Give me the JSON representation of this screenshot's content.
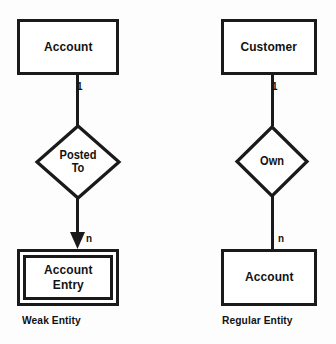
{
  "diagram": {
    "type": "entity-relationship-diagram",
    "background_color": "#fdfdfd",
    "stroke_color": "#1a1a1a",
    "text_color": "#121212",
    "panels": [
      {
        "id": "weak-entity-panel",
        "caption": "Weak Entity",
        "parent_entity": "Account",
        "relationship": "Posted\nTo",
        "relationship_line1": "Posted",
        "relationship_line2": "To",
        "child_entity_line1": "Account",
        "child_entity_line2": "Entry",
        "cardinality_top": "1",
        "cardinality_bottom": "n",
        "child_entity_style": "double-rectangle",
        "connector_bottom_style": "arrow"
      },
      {
        "id": "regular-entity-panel",
        "caption": "Regular Entity",
        "parent_entity": "Customer",
        "relationship": "Own",
        "child_entity_line1": "Account",
        "cardinality_top": "1",
        "cardinality_bottom": "n",
        "child_entity_style": "single-rectangle",
        "connector_bottom_style": "plain"
      }
    ]
  }
}
